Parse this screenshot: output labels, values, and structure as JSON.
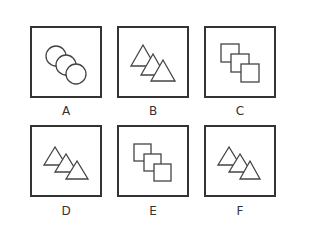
{
  "colors": {
    "stroke": "#333333",
    "background": "#ffffff"
  },
  "panels": [
    {
      "label": "A",
      "shape": "circles",
      "count": 3,
      "x": 30,
      "y": 26
    },
    {
      "label": "B",
      "shape": "triangles",
      "count": 3,
      "x": 117,
      "y": 26
    },
    {
      "label": "C",
      "shape": "squares",
      "count": 3,
      "x": 204,
      "y": 26
    },
    {
      "label": "D",
      "shape": "triangles",
      "count": 3,
      "x": 30,
      "y": 125
    },
    {
      "label": "E",
      "shape": "squares",
      "count": 3,
      "x": 117,
      "y": 125
    },
    {
      "label": "F",
      "shape": "triangles",
      "count": 3,
      "x": 204,
      "y": 125
    }
  ]
}
